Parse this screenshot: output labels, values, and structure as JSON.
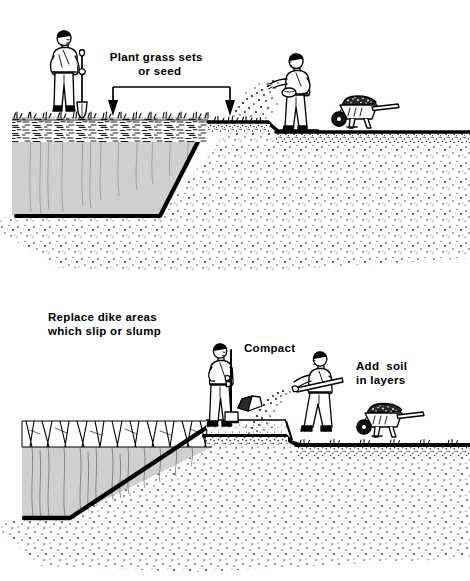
{
  "figure": {
    "panels": [
      {
        "id": "top",
        "name": "plant-grass-panel",
        "labels": [
          {
            "name": "plant-grass-label",
            "line1": "Plant grass sets",
            "line2": "or seed"
          }
        ],
        "annotations": {
          "bracket": "horizontal bracket with two down arrows indicating seeding area"
        },
        "figures": [
          {
            "name": "worker-with-spade",
            "description": "man standing holding spade"
          },
          {
            "name": "worker-broadcasting-seed",
            "description": "man scattering grass seed by hand"
          },
          {
            "name": "wheelbarrow-loaded",
            "description": "wheelbarrow filled with soil"
          }
        ],
        "strata": [
          {
            "name": "grass-sod-layer",
            "description": "grass tufts and sod"
          },
          {
            "name": "water-body",
            "description": "gray pond water cross-section"
          },
          {
            "name": "soil-fill",
            "description": "stippled soil fill slope"
          }
        ]
      },
      {
        "id": "bottom",
        "name": "replace-dike-panel",
        "labels": [
          {
            "name": "replace-dike-label",
            "line1": "Replace dike areas",
            "line2": "which slip or slump"
          },
          {
            "name": "compact-label",
            "line1": "Compact",
            "line2": ""
          },
          {
            "name": "add-soil-label",
            "line1": "Add  soil",
            "line2": "in layers"
          }
        ],
        "figures": [
          {
            "name": "worker-with-tamper",
            "description": "man compacting soil with hand tamper"
          },
          {
            "name": "worker-shoveling-soil",
            "description": "man throwing soil with shovel"
          },
          {
            "name": "wheelbarrow-loaded",
            "description": "wheelbarrow filled with soil"
          }
        ],
        "strata": [
          {
            "name": "slumped-dike-layer",
            "description": "cracked slumping dike surface"
          },
          {
            "name": "water-body",
            "description": "gray water cross-section with crack lines"
          },
          {
            "name": "new-fill-layer",
            "description": "new compacted soil layer"
          },
          {
            "name": "soil-fill",
            "description": "stippled soil fill slope"
          }
        ]
      }
    ],
    "colors": {
      "ink": "#000000",
      "paper": "#ffffff",
      "water_gray": "#cfcfcf",
      "fill_gray": "#e8e8e8"
    }
  }
}
